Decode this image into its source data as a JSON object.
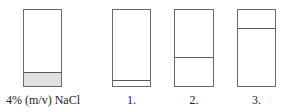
{
  "diagram": {
    "containers": [
      {
        "label": "4% (m/v) NaCl",
        "left": 23,
        "top": 9,
        "width": 39,
        "height": 78,
        "fill_top": 72,
        "fill_color": "#e0e0e0",
        "label_left": 0,
        "label_width": 86
      },
      {
        "label": "1.",
        "left": 112,
        "top": 9,
        "width": 39,
        "height": 78,
        "fill_top": 80,
        "fill_color": "#ffffff",
        "label_left": 112,
        "label_width": 39
      },
      {
        "label": "2.",
        "left": 174,
        "top": 9,
        "width": 40,
        "height": 78,
        "fill_top": 57,
        "fill_color": "#ffffff",
        "label_left": 174,
        "label_width": 40
      },
      {
        "label": "3.",
        "left": 237,
        "top": 9,
        "width": 39,
        "height": 78,
        "fill_top": 28,
        "fill_color": "#ffffff",
        "label_left": 237,
        "label_width": 39
      }
    ],
    "label_top": 93
  }
}
